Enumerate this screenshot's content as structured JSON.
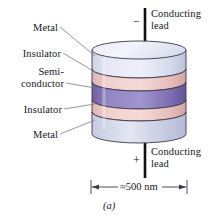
{
  "figure": {
    "caption": "(a)",
    "dimension_label": "≈500 nm",
    "layer_labels": [
      {
        "key": "metal_top",
        "text": "Metal"
      },
      {
        "key": "insulator_top",
        "text": "Insulator"
      },
      {
        "key": "semiconductor_line1",
        "text": "Semi-"
      },
      {
        "key": "semiconductor_line2",
        "text": "conductor"
      },
      {
        "key": "insulator_bottom",
        "text": "Insulator"
      },
      {
        "key": "metal_bottom",
        "text": "Metal"
      }
    ],
    "leads": {
      "top": {
        "line1": "Conducting",
        "line2": "lead",
        "polarity": "−"
      },
      "bottom": {
        "line1": "Conducting",
        "line2": "lead",
        "polarity": "+"
      }
    },
    "colors": {
      "metal": "#dfe2f0",
      "metal_shadow": "#b9bfd8",
      "insulator": "#edcac6",
      "insulator_shadow": "#d9a7a6",
      "semiconductor": "#8d7cba",
      "semiconductor_shadow": "#6f5fa0",
      "outline": "#3a3a4a",
      "lead": "#0f0f14",
      "leader": "#6e6e7a",
      "text": "#17171a"
    }
  }
}
